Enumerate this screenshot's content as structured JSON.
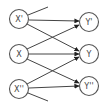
{
  "diagram": {
    "type": "bipartite-graph",
    "left_nodes": [
      {
        "id": "xp",
        "label": "X'",
        "cx": 19,
        "cy": 19
      },
      {
        "id": "x",
        "label": "X",
        "cx": 19,
        "cy": 54
      },
      {
        "id": "xpp",
        "label": "X''",
        "cx": 19,
        "cy": 89
      }
    ],
    "right_nodes": [
      {
        "id": "yp",
        "label": "Y'",
        "cx": 89,
        "cy": 22
      },
      {
        "id": "y",
        "label": "Y",
        "cx": 89,
        "cy": 54
      },
      {
        "id": "ypp",
        "label": "Y''",
        "cx": 89,
        "cy": 86
      }
    ],
    "edges": [
      {
        "from": "X'",
        "to": "Y'"
      },
      {
        "from": "X'",
        "to": "Y"
      },
      {
        "from": "X",
        "to": "Y'"
      },
      {
        "from": "X",
        "to": "Y"
      },
      {
        "from": "X",
        "to": "Y''"
      },
      {
        "from": "X''",
        "to": "Y"
      },
      {
        "from": "X''",
        "to": "Y''"
      }
    ],
    "stubs": [
      {
        "from": "X'",
        "direction": "up-right"
      },
      {
        "from": "X''",
        "direction": "down-right"
      }
    ],
    "colors": {
      "stroke": "#444444",
      "node_fill": "#ffffff"
    }
  }
}
